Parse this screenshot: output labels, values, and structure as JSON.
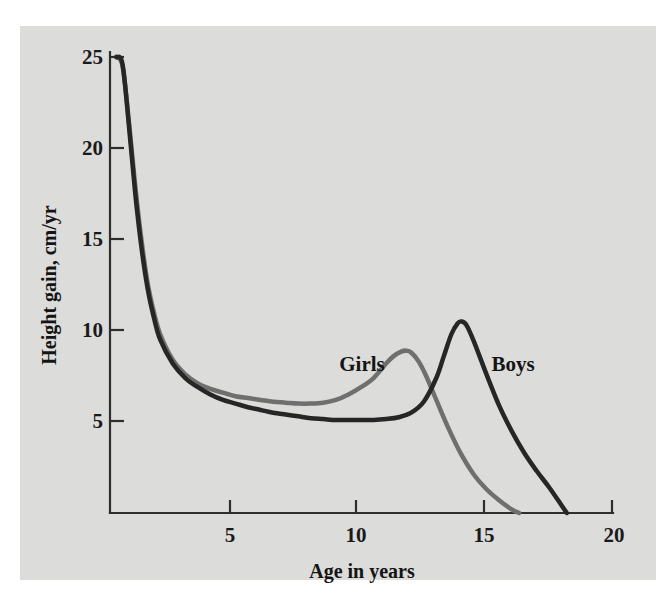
{
  "figure": {
    "background_color": "#ffffff",
    "plate_color": "#dcdcda"
  },
  "chart_data": {
    "type": "line",
    "title": "",
    "subtitle": "",
    "xlabel": "Age in years",
    "ylabel": "Height gain, cm/yr",
    "xlim": [
      0,
      20
    ],
    "ylim": [
      0,
      26
    ],
    "xticks": [
      5,
      10,
      15,
      20
    ],
    "yticks": [
      5,
      10,
      15,
      20,
      25
    ],
    "xtick_labels": [
      "5",
      "10",
      "15",
      "20"
    ],
    "ytick_labels": [
      "5",
      "10",
      "15",
      "20",
      "25"
    ],
    "grid": false,
    "legend_position": "inline-annotations",
    "annotations": [
      {
        "text": "Girls",
        "x": 10.1,
        "y": 8.7
      },
      {
        "text": "Boys",
        "x": 15.6,
        "y": 8.7
      }
    ],
    "series": [
      {
        "name": "Girls",
        "color": "#6f6f6f",
        "line_width": 4.5,
        "peak": {
          "age": 11.8,
          "value": 8.9
        },
        "x": [
          0.25,
          0.5,
          0.75,
          1.0,
          1.25,
          1.5,
          1.75,
          2.0,
          2.5,
          3.0,
          3.5,
          4.0,
          4.5,
          5.0,
          5.5,
          6.0,
          6.5,
          7.0,
          7.5,
          8.0,
          8.5,
          9.0,
          9.5,
          10.0,
          10.5,
          11.0,
          11.3,
          11.6,
          11.8,
          12.0,
          12.3,
          12.6,
          13.0,
          13.5,
          14.0,
          14.5,
          15.0,
          15.5,
          16.0,
          16.3
        ],
        "y": [
          25.0,
          24.5,
          21.5,
          18.0,
          15.0,
          12.6,
          11.0,
          9.8,
          8.4,
          7.6,
          7.1,
          6.8,
          6.6,
          6.4,
          6.3,
          6.2,
          6.1,
          6.05,
          6.0,
          6.0,
          6.05,
          6.2,
          6.5,
          6.9,
          7.4,
          8.2,
          8.6,
          8.85,
          8.9,
          8.8,
          8.3,
          7.5,
          6.2,
          4.6,
          3.2,
          2.1,
          1.3,
          0.7,
          0.2,
          0.0
        ]
      },
      {
        "name": "Boys",
        "color": "#262626",
        "line_width": 4.5,
        "peak": {
          "age": 14.0,
          "value": 10.5
        },
        "x": [
          0.25,
          0.5,
          0.75,
          1.0,
          1.25,
          1.5,
          1.75,
          2.0,
          2.5,
          3.0,
          3.5,
          4.0,
          4.5,
          5.0,
          5.5,
          6.0,
          6.5,
          7.0,
          7.5,
          8.0,
          8.5,
          9.0,
          9.5,
          10.0,
          10.5,
          11.0,
          11.5,
          12.0,
          12.5,
          13.0,
          13.3,
          13.6,
          13.85,
          14.0,
          14.2,
          14.5,
          15.0,
          15.5,
          16.0,
          16.5,
          17.0,
          17.5,
          18.0,
          18.2
        ],
        "y": [
          25.0,
          24.6,
          21.3,
          17.6,
          14.6,
          12.3,
          10.7,
          9.5,
          8.2,
          7.4,
          6.9,
          6.5,
          6.2,
          6.0,
          5.8,
          5.65,
          5.5,
          5.4,
          5.3,
          5.2,
          5.15,
          5.1,
          5.1,
          5.1,
          5.1,
          5.15,
          5.25,
          5.5,
          6.1,
          7.4,
          8.6,
          9.8,
          10.4,
          10.5,
          10.3,
          9.4,
          7.6,
          5.9,
          4.5,
          3.3,
          2.3,
          1.4,
          0.4,
          0.0
        ]
      }
    ]
  },
  "axis": {
    "x_title": "Age in years",
    "y_title": "Height gain, cm/yr"
  }
}
